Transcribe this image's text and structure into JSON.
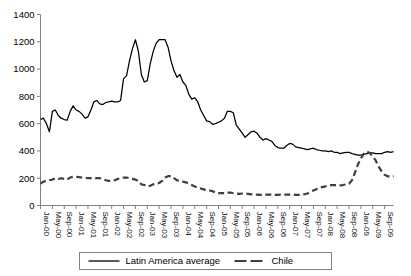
{
  "chart_data": {
    "type": "line",
    "title": "",
    "xlabel": "",
    "ylabel": "",
    "ylim": [
      0,
      1400
    ],
    "ytick_values": [
      0,
      200,
      400,
      600,
      800,
      1000,
      1200,
      1400
    ],
    "ytick_labels": [
      "0",
      "200",
      "400",
      "600",
      "800",
      "1000",
      "1200",
      "1400"
    ],
    "grid": false,
    "legend_position": "bottom",
    "x_tick_interval_months": 4,
    "x_tick_labels": [
      "Jan-00",
      "May-00",
      "Sep-00",
      "Jan-01",
      "May-01",
      "Sep-01",
      "Jan-02",
      "May-02",
      "Sep-02",
      "Jan-03",
      "May-03",
      "Sep-03",
      "Jan-04",
      "May-04",
      "Sep-04",
      "Jan-05",
      "May-05",
      "Sep-05",
      "Jan-06",
      "May-06",
      "Sep-06",
      "Jan-07",
      "May-07",
      "Sep-07",
      "Jan-08",
      "May-08",
      "Sep-08",
      "Jan-09",
      "May-09",
      "Sep-09"
    ],
    "x": [
      "Jan-00",
      "Feb-00",
      "Mar-00",
      "Apr-00",
      "May-00",
      "Jun-00",
      "Jul-00",
      "Aug-00",
      "Sep-00",
      "Oct-00",
      "Nov-00",
      "Dec-00",
      "Jan-01",
      "Feb-01",
      "Mar-01",
      "Apr-01",
      "May-01",
      "Jun-01",
      "Jul-01",
      "Aug-01",
      "Sep-01",
      "Oct-01",
      "Nov-01",
      "Dec-01",
      "Jan-02",
      "Feb-02",
      "Mar-02",
      "Apr-02",
      "May-02",
      "Jun-02",
      "Jul-02",
      "Aug-02",
      "Sep-02",
      "Oct-02",
      "Nov-02",
      "Dec-02",
      "Jan-03",
      "Feb-03",
      "Mar-03",
      "Apr-03",
      "May-03",
      "Jun-03",
      "Jul-03",
      "Aug-03",
      "Sep-03",
      "Oct-03",
      "Nov-03",
      "Dec-03",
      "Jan-04",
      "Feb-04",
      "Mar-04",
      "Apr-04",
      "May-04",
      "Jun-04",
      "Jul-04",
      "Aug-04",
      "Sep-04",
      "Oct-04",
      "Nov-04",
      "Dec-04",
      "Jan-05",
      "Feb-05",
      "Mar-05",
      "Apr-05",
      "May-05",
      "Jun-05",
      "Jul-05",
      "Aug-05",
      "Sep-05",
      "Oct-05",
      "Nov-05",
      "Dec-05",
      "Jan-06",
      "Feb-06",
      "Mar-06",
      "Apr-06",
      "May-06",
      "Jun-06",
      "Jul-06",
      "Aug-06",
      "Sep-06",
      "Oct-06",
      "Nov-06",
      "Dec-06",
      "Jan-07",
      "Feb-07",
      "Mar-07",
      "Apr-07",
      "May-07",
      "Jun-07",
      "Jul-07",
      "Aug-07",
      "Sep-07",
      "Oct-07",
      "Nov-07",
      "Dec-07",
      "Jan-08",
      "Feb-08",
      "Mar-08",
      "Apr-08",
      "May-08",
      "Jun-08",
      "Jul-08",
      "Aug-08",
      "Sep-08",
      "Oct-08",
      "Nov-08",
      "Dec-08",
      "Jan-09",
      "Feb-09",
      "Mar-09",
      "Apr-09",
      "May-09",
      "Jun-09",
      "Jul-09",
      "Aug-09",
      "Sep-09",
      "Oct-09",
      "Nov-09",
      "Dec-09"
    ],
    "series": [
      {
        "name": "Latin America average",
        "style": "solid",
        "color": "#000000",
        "values": [
          630,
          640,
          600,
          540,
          690,
          700,
          660,
          640,
          630,
          625,
          690,
          730,
          700,
          690,
          670,
          640,
          650,
          700,
          760,
          770,
          745,
          740,
          755,
          760,
          765,
          760,
          760,
          770,
          930,
          950,
          1060,
          1150,
          1215,
          1130,
          960,
          905,
          915,
          1040,
          1130,
          1190,
          1215,
          1215,
          1215,
          1160,
          1060,
          990,
          940,
          960,
          905,
          880,
          815,
          780,
          790,
          760,
          700,
          660,
          620,
          615,
          595,
          600,
          610,
          620,
          640,
          690,
          690,
          680,
          590,
          560,
          530,
          500,
          520,
          540,
          545,
          530,
          500,
          480,
          490,
          480,
          470,
          440,
          425,
          420,
          420,
          440,
          455,
          450,
          430,
          425,
          420,
          415,
          410,
          415,
          420,
          410,
          405,
          400,
          400,
          395,
          400,
          390,
          390,
          380,
          385,
          390,
          390,
          380,
          375,
          370,
          370,
          375,
          380,
          385,
          385,
          380,
          380,
          380,
          390,
          395,
          390,
          395
        ]
      },
      {
        "name": "Chile",
        "style": "dashed",
        "color": "#3f3f3f",
        "values": [
          160,
          175,
          180,
          185,
          190,
          200,
          195,
          200,
          195,
          190,
          205,
          210,
          210,
          208,
          205,
          205,
          200,
          200,
          198,
          200,
          200,
          195,
          185,
          180,
          180,
          185,
          195,
          200,
          205,
          205,
          200,
          195,
          190,
          180,
          155,
          150,
          140,
          145,
          155,
          160,
          165,
          180,
          205,
          215,
          215,
          200,
          185,
          180,
          175,
          170,
          160,
          150,
          140,
          130,
          125,
          118,
          110,
          110,
          105,
          95,
          90,
          90,
          90,
          95,
          95,
          90,
          88,
          85,
          88,
          88,
          85,
          82,
          80,
          80,
          78,
          78,
          80,
          80,
          80,
          78,
          78,
          80,
          80,
          80,
          80,
          80,
          78,
          78,
          80,
          82,
          88,
          100,
          110,
          120,
          130,
          135,
          140,
          145,
          150,
          150,
          150,
          148,
          150,
          155,
          160,
          185,
          240,
          300,
          345,
          380,
          395,
          385,
          360,
          330,
          285,
          250,
          225,
          215,
          210,
          215
        ]
      }
    ]
  },
  "legend": {
    "items": [
      {
        "label": "Latin America average",
        "style": "solid"
      },
      {
        "label": "Chile",
        "style": "dashed"
      }
    ]
  },
  "axis": {
    "y_max_label": "1400",
    "y_min_label": "0"
  }
}
